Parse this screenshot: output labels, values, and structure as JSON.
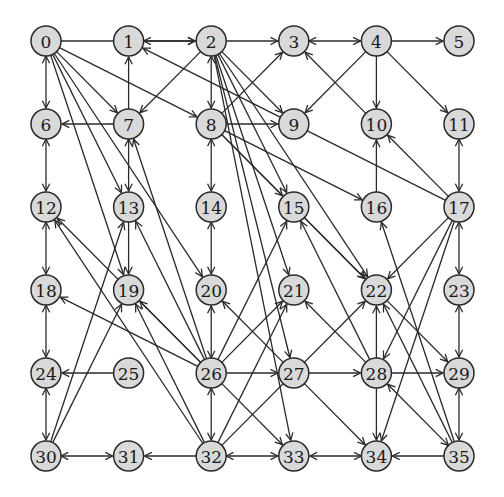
{
  "diagram": {
    "type": "directed-graph",
    "layout": "grid",
    "rows": 6,
    "cols": 6,
    "origin": [
      46,
      41
    ],
    "spacing": [
      82.6,
      83
    ],
    "node_radius": 15,
    "colors": {
      "node_fill": "#d9d9d9",
      "node_stroke": "#2a2a2a",
      "edge": "#2a2a2a",
      "label": "#1a1a1a"
    },
    "nodes": [
      {
        "id": 0,
        "label": "0"
      },
      {
        "id": 1,
        "label": "1"
      },
      {
        "id": 2,
        "label": "2"
      },
      {
        "id": 3,
        "label": "3"
      },
      {
        "id": 4,
        "label": "4"
      },
      {
        "id": 5,
        "label": "5"
      },
      {
        "id": 6,
        "label": "6"
      },
      {
        "id": 7,
        "label": "7"
      },
      {
        "id": 8,
        "label": "8"
      },
      {
        "id": 9,
        "label": "9"
      },
      {
        "id": 10,
        "label": "10"
      },
      {
        "id": 11,
        "label": "11"
      },
      {
        "id": 12,
        "label": "12"
      },
      {
        "id": 13,
        "label": "13"
      },
      {
        "id": 14,
        "label": "14"
      },
      {
        "id": 15,
        "label": "15"
      },
      {
        "id": 16,
        "label": "16"
      },
      {
        "id": 17,
        "label": "17"
      },
      {
        "id": 18,
        "label": "18"
      },
      {
        "id": 19,
        "label": "19"
      },
      {
        "id": 20,
        "label": "20"
      },
      {
        "id": 21,
        "label": "21"
      },
      {
        "id": 22,
        "label": "22"
      },
      {
        "id": 23,
        "label": "23"
      },
      {
        "id": 24,
        "label": "24"
      },
      {
        "id": 25,
        "label": "25"
      },
      {
        "id": 26,
        "label": "26"
      },
      {
        "id": 27,
        "label": "27"
      },
      {
        "id": 28,
        "label": "28"
      },
      {
        "id": 29,
        "label": "29"
      },
      {
        "id": 30,
        "label": "30"
      },
      {
        "id": 31,
        "label": "31"
      },
      {
        "id": 32,
        "label": "32"
      },
      {
        "id": 33,
        "label": "33"
      },
      {
        "id": 34,
        "label": "34"
      },
      {
        "id": 35,
        "label": "35"
      }
    ],
    "edges": [
      {
        "from": 0,
        "to": 2,
        "dir": "forward"
      },
      {
        "from": 1,
        "to": 2,
        "dir": "both"
      },
      {
        "from": 2,
        "to": 3,
        "dir": "forward"
      },
      {
        "from": 3,
        "to": 4,
        "dir": "both"
      },
      {
        "from": 4,
        "to": 5,
        "dir": "forward"
      },
      {
        "from": 0,
        "to": 6,
        "dir": "both"
      },
      {
        "from": 0,
        "to": 7,
        "dir": "forward"
      },
      {
        "from": 0,
        "to": 8,
        "dir": "forward"
      },
      {
        "from": 0,
        "to": 13,
        "dir": "forward"
      },
      {
        "from": 0,
        "to": 19,
        "dir": "forward"
      },
      {
        "from": 0,
        "to": 20,
        "dir": "forward"
      },
      {
        "from": 7,
        "to": 1,
        "dir": "forward"
      },
      {
        "from": 7,
        "to": 6,
        "dir": "forward"
      },
      {
        "from": 2,
        "to": 7,
        "dir": "forward"
      },
      {
        "from": 2,
        "to": 8,
        "dir": "both"
      },
      {
        "from": 2,
        "to": 9,
        "dir": "forward"
      },
      {
        "from": 2,
        "to": 15,
        "dir": "forward"
      },
      {
        "from": 2,
        "to": 21,
        "dir": "forward"
      },
      {
        "from": 2,
        "to": 22,
        "dir": "forward"
      },
      {
        "from": 2,
        "to": 27,
        "dir": "forward"
      },
      {
        "from": 2,
        "to": 33,
        "dir": "forward"
      },
      {
        "from": 8,
        "to": 3,
        "dir": "forward"
      },
      {
        "from": 8,
        "to": 9,
        "dir": "forward"
      },
      {
        "from": 8,
        "to": 14,
        "dir": "both"
      },
      {
        "from": 8,
        "to": 15,
        "dir": "forward"
      },
      {
        "from": 8,
        "to": 16,
        "dir": "forward"
      },
      {
        "from": 8,
        "to": 22,
        "dir": "forward"
      },
      {
        "from": 4,
        "to": 9,
        "dir": "forward"
      },
      {
        "from": 4,
        "to": 10,
        "dir": "forward"
      },
      {
        "from": 4,
        "to": 11,
        "dir": "forward"
      },
      {
        "from": 10,
        "to": 3,
        "dir": "forward"
      },
      {
        "from": 16,
        "to": 10,
        "dir": "forward"
      },
      {
        "from": 17,
        "to": 10,
        "dir": "forward"
      },
      {
        "from": 17,
        "to": 1,
        "dir": "forward"
      },
      {
        "from": 11,
        "to": 17,
        "dir": "both"
      },
      {
        "from": 6,
        "to": 12,
        "dir": "both"
      },
      {
        "from": 7,
        "to": 13,
        "dir": "both"
      },
      {
        "from": 13,
        "to": 19,
        "dir": "forward"
      },
      {
        "from": 14,
        "to": 20,
        "dir": "both"
      },
      {
        "from": 12,
        "to": 18,
        "dir": "both"
      },
      {
        "from": 15,
        "to": 22,
        "dir": "forward"
      },
      {
        "from": 17,
        "to": 22,
        "dir": "forward"
      },
      {
        "from": 17,
        "to": 23,
        "dir": "both"
      },
      {
        "from": 17,
        "to": 28,
        "dir": "forward"
      },
      {
        "from": 17,
        "to": 34,
        "dir": "forward"
      },
      {
        "from": 18,
        "to": 24,
        "dir": "both"
      },
      {
        "from": 24,
        "to": 30,
        "dir": "both"
      },
      {
        "from": 30,
        "to": 31,
        "dir": "both"
      },
      {
        "from": 30,
        "to": 13,
        "dir": "forward"
      },
      {
        "from": 30,
        "to": 19,
        "dir": "forward"
      },
      {
        "from": 32,
        "to": 31,
        "dir": "forward"
      },
      {
        "from": 32,
        "to": 33,
        "dir": "both"
      },
      {
        "from": 32,
        "to": 12,
        "dir": "forward"
      },
      {
        "from": 32,
        "to": 19,
        "dir": "forward"
      },
      {
        "from": 32,
        "to": 21,
        "dir": "forward"
      },
      {
        "from": 32,
        "to": 22,
        "dir": "forward"
      },
      {
        "from": 26,
        "to": 32,
        "dir": "both"
      },
      {
        "from": 25,
        "to": 24,
        "dir": "forward"
      },
      {
        "from": 26,
        "to": 20,
        "dir": "both"
      },
      {
        "from": 26,
        "to": 7,
        "dir": "forward"
      },
      {
        "from": 26,
        "to": 13,
        "dir": "forward"
      },
      {
        "from": 26,
        "to": 12,
        "dir": "forward"
      },
      {
        "from": 26,
        "to": 18,
        "dir": "forward"
      },
      {
        "from": 26,
        "to": 19,
        "dir": "forward"
      },
      {
        "from": 26,
        "to": 15,
        "dir": "forward"
      },
      {
        "from": 26,
        "to": 21,
        "dir": "forward"
      },
      {
        "from": 26,
        "to": 27,
        "dir": "forward"
      },
      {
        "from": 26,
        "to": 33,
        "dir": "forward"
      },
      {
        "from": 27,
        "to": 20,
        "dir": "forward"
      },
      {
        "from": 27,
        "to": 28,
        "dir": "forward"
      },
      {
        "from": 27,
        "to": 34,
        "dir": "forward"
      },
      {
        "from": 28,
        "to": 15,
        "dir": "forward"
      },
      {
        "from": 28,
        "to": 21,
        "dir": "forward"
      },
      {
        "from": 28,
        "to": 22,
        "dir": "forward"
      },
      {
        "from": 28,
        "to": 29,
        "dir": "forward"
      },
      {
        "from": 28,
        "to": 34,
        "dir": "forward"
      },
      {
        "from": 22,
        "to": 29,
        "dir": "forward"
      },
      {
        "from": 23,
        "to": 29,
        "dir": "both"
      },
      {
        "from": 29,
        "to": 35,
        "dir": "both"
      },
      {
        "from": 35,
        "to": 34,
        "dir": "forward"
      },
      {
        "from": 35,
        "to": 28,
        "dir": "both"
      },
      {
        "from": 35,
        "to": 16,
        "dir": "forward"
      },
      {
        "from": 35,
        "to": 22,
        "dir": "forward"
      },
      {
        "from": 34,
        "to": 33,
        "dir": "both"
      }
    ]
  }
}
